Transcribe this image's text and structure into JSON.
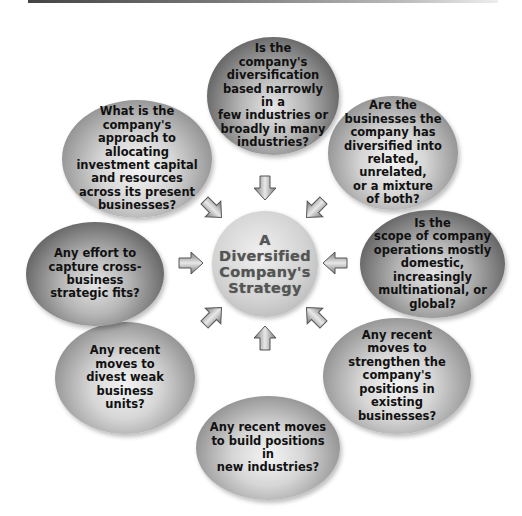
{
  "diagram": {
    "center": {
      "label": "A\nDiversified\nCompany's\nStrategy"
    },
    "nodes": [
      {
        "id": "top",
        "text": "Is the\ncompany's\ndiversification\nbased narrowly in a\nfew industries or\nbroadly in many\nindustries?"
      },
      {
        "id": "upper-right",
        "text": "Are the\nbusinesses the\ncompany has\ndiversified into\nrelated, unrelated,\nor a mixture\nof both?"
      },
      {
        "id": "right",
        "text": "Is the\nscope of company\noperations mostly\ndomestic,\nincreasingly\nmultinational, or\nglobal?"
      },
      {
        "id": "lower-right",
        "text": "Any recent\nmoves to\nstrengthen the\ncompany's\npositions in\nexisting\nbusinesses?"
      },
      {
        "id": "bottom",
        "text": "Any recent moves\nto build positions in\nnew industries?"
      },
      {
        "id": "lower-left",
        "text": "Any recent\nmoves to\ndivest weak\nbusiness\nunits?"
      },
      {
        "id": "left",
        "text": "Any effort to\ncapture cross-\nbusiness\nstrategic fits?"
      },
      {
        "id": "upper-left",
        "text": "What is the\ncompany's\napproach to allocating\ninvestment capital\nand resources\nacross its present\nbusinesses?"
      }
    ],
    "arrows": [
      {
        "direction": "down",
        "icon": "arrow-down-icon"
      },
      {
        "direction": "down-left",
        "icon": "arrow-down-left-icon"
      },
      {
        "direction": "left",
        "icon": "arrow-left-icon"
      },
      {
        "direction": "up-left",
        "icon": "arrow-up-left-icon"
      },
      {
        "direction": "up",
        "icon": "arrow-up-icon"
      },
      {
        "direction": "up-right",
        "icon": "arrow-up-right-icon"
      },
      {
        "direction": "right",
        "icon": "arrow-right-icon"
      },
      {
        "direction": "down-right",
        "icon": "arrow-down-right-icon"
      }
    ]
  }
}
